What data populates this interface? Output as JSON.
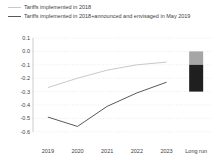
{
  "legend": {
    "items": [
      {
        "label": "Tariffs implemented in 2018",
        "color": "#c9c9c9"
      },
      {
        "label": "Tariffs implemented in 2018+announced and envisaged in May 2019",
        "color": "#595959"
      }
    ]
  },
  "chart_data": {
    "type": "line",
    "title": "",
    "xlabel": "",
    "ylabel": "",
    "categories": [
      "2019",
      "2020",
      "2021",
      "2022",
      "2023",
      "Long run"
    ],
    "series": [
      {
        "name": "Tariffs implemented in 2018",
        "type": "line",
        "color": "#c9c9c9",
        "values": [
          -0.27,
          -0.2,
          -0.14,
          -0.1,
          -0.08,
          null
        ]
      },
      {
        "name": "Tariffs implemented in 2018+announced and envisaged in May 2019",
        "type": "line",
        "color": "#595959",
        "values": [
          -0.49,
          -0.56,
          -0.41,
          -0.31,
          -0.23,
          null
        ]
      }
    ],
    "long_run_bar": {
      "category": "Long run",
      "note": "stacked bar at Long run",
      "segments": [
        {
          "name": "tariffs-implemented-2018",
          "color": "#a6a6a6",
          "from": 0,
          "to": -0.1
        },
        {
          "name": "announced-and-envisaged-additional",
          "color": "#1f1f1f",
          "from": -0.1,
          "to": -0.3
        }
      ],
      "total": -0.3
    },
    "yticks": [
      0.1,
      0.0,
      -0.1,
      -0.2,
      -0.3,
      -0.4,
      -0.5,
      -0.6
    ],
    "ylim": [
      -0.6,
      0.1
    ],
    "grid": "horizontal-dotted",
    "legend_position": "top-left"
  }
}
